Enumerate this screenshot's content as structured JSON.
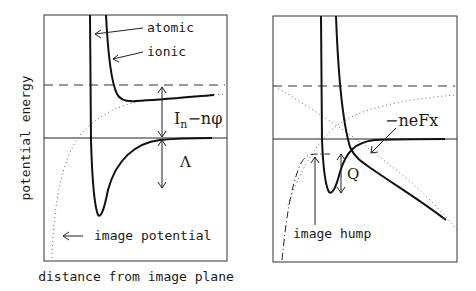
{
  "left_panel": {
    "y_axis_label": "potential energy",
    "x_axis_label": "distance from image plane",
    "labels": {
      "atomic": "atomic",
      "ionic": "ionic",
      "gap_In": "I",
      "gap_In_sub": "n",
      "gap_rest": "−nφ",
      "lambda": "Λ",
      "image_potential": "image potential"
    }
  },
  "right_panel": {
    "labels": {
      "field": "−neFx",
      "q": "Q",
      "image_hump": "image hump"
    }
  }
}
